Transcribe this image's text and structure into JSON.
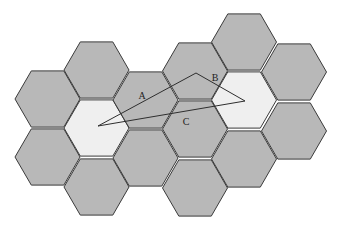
{
  "diagram": {
    "colors": {
      "cell_fill": "#b8b8b8",
      "highlight_fill": "#efefef",
      "stroke": "#3a3a3a"
    },
    "hex_radius": 32.5,
    "cells": [
      {
        "cx": 47.5,
        "cy": 99,
        "highlight": false
      },
      {
        "cx": 47.5,
        "cy": 157,
        "highlight": false
      },
      {
        "cx": 96.5,
        "cy": 70,
        "highlight": false
      },
      {
        "cx": 96.5,
        "cy": 128,
        "highlight": true
      },
      {
        "cx": 96.5,
        "cy": 187,
        "highlight": false
      },
      {
        "cx": 145.5,
        "cy": 100,
        "highlight": false
      },
      {
        "cx": 145.5,
        "cy": 158,
        "highlight": false
      },
      {
        "cx": 195,
        "cy": 71,
        "highlight": false
      },
      {
        "cx": 195,
        "cy": 129,
        "highlight": false
      },
      {
        "cx": 195,
        "cy": 188,
        "highlight": false
      },
      {
        "cx": 244,
        "cy": 42,
        "highlight": false
      },
      {
        "cx": 244,
        "cy": 100,
        "highlight": true
      },
      {
        "cx": 244,
        "cy": 159,
        "highlight": false
      },
      {
        "cx": 294,
        "cy": 72,
        "highlight": false
      },
      {
        "cx": 294,
        "cy": 131,
        "highlight": false
      }
    ],
    "triangle": [
      [
        98,
        126
      ],
      [
        196,
        73
      ],
      [
        245,
        101
      ]
    ],
    "labels": [
      {
        "text": "A",
        "x": 142,
        "y": 99
      },
      {
        "text": "B",
        "x": 215,
        "y": 81
      },
      {
        "text": "C",
        "x": 186,
        "y": 125
      }
    ]
  }
}
